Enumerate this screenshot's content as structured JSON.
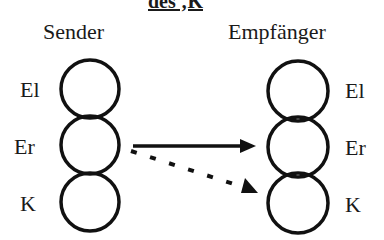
{
  "title": "des ‚K",
  "sender": {
    "heading": "Sender",
    "labels": [
      "El",
      "Er",
      "K"
    ]
  },
  "receiver": {
    "heading": "Empfänger",
    "labels": [
      "El",
      "Er",
      "K"
    ]
  },
  "arrows": [
    {
      "from": "Sender Er",
      "to": "Empfänger Er",
      "style": "solid"
    },
    {
      "from": "Sender Er",
      "to": "Empfänger K",
      "style": "dashed"
    }
  ]
}
